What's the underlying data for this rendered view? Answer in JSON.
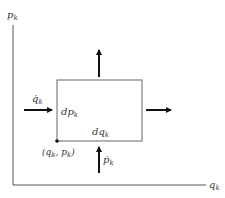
{
  "diagram": {
    "type": "phase-space-flow",
    "colors": {
      "axis": "#555555",
      "box": "#666666",
      "arrow": "#111111",
      "text": "#333333"
    },
    "axes": {
      "y_label": {
        "base": "p",
        "sub": "k"
      },
      "x_label": {
        "base": "q",
        "sub": "k"
      }
    },
    "box": {
      "left_label": {
        "base": "dp",
        "sub": "k"
      },
      "bottom_label": {
        "base": "dq",
        "sub": "k"
      },
      "corner_point_label": "(q_k, p_k)",
      "corner_point_text": {
        "open": "(",
        "q": "q",
        "qsub": "k",
        "sep": ", ",
        "p": "p",
        "psub": "k",
        "close": ")"
      }
    },
    "arrows": {
      "left_in": {
        "base": "q̇",
        "sub": "k",
        "direction": "right"
      },
      "bottom_in": {
        "base": "ṗ",
        "sub": "k",
        "direction": "up"
      },
      "top_out": {
        "direction": "up"
      },
      "right_out": {
        "direction": "right"
      }
    }
  }
}
